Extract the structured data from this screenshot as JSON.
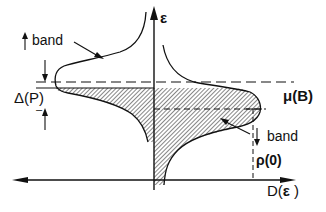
{
  "diagram": {
    "type": "density-of-states schematic",
    "axes": {
      "vertical": {
        "label": "ε",
        "direction": "up"
      },
      "horizontal": {
        "label": "D(ε )",
        "direction": "both"
      }
    },
    "labels": {
      "upper_band": "band",
      "lower_band": "band",
      "gap": "Δ(P)",
      "chemical_potential": "μ(B)",
      "rho_zero": "ρ(0)",
      "d_label": "D(",
      "d_eps": "ε",
      "d_close": " )",
      "eps_axis": "ε"
    },
    "annotations": {
      "gap_minus": "–",
      "gap_plus": "+"
    },
    "colors": {
      "ink": "#111111",
      "background": "#ffffff"
    }
  }
}
